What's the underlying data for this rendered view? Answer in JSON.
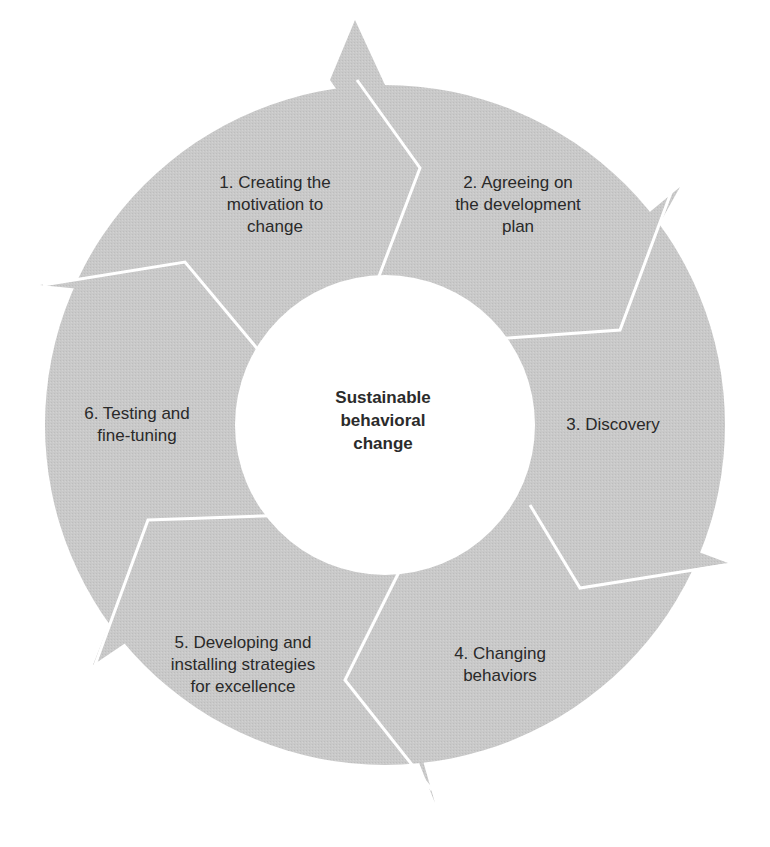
{
  "diagram": {
    "type": "cycle",
    "center": {
      "label": "Sustainable\nbehavioral\nchange"
    },
    "steps": [
      {
        "number": 1,
        "label": "1. Creating the\nmotivation to\nchange"
      },
      {
        "number": 2,
        "label": "2. Agreeing on\nthe development\nplan"
      },
      {
        "number": 3,
        "label": "3. Discovery"
      },
      {
        "number": 4,
        "label": "4. Changing\nbehaviors"
      },
      {
        "number": 5,
        "label": "5. Developing and\ninstalling strategies\nfor excellence"
      },
      {
        "number": 6,
        "label": "6. Testing and\nfine-tuning"
      }
    ],
    "colors": {
      "segment_fill": "#c8c8c8",
      "separator": "#ffffff",
      "text": "#2a2a2a",
      "background": "#ffffff"
    }
  }
}
